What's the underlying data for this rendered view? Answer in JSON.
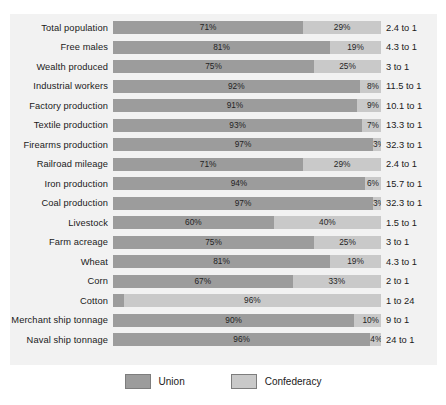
{
  "chart_data": {
    "type": "bar",
    "subtype": "stacked-horizontal-100pct",
    "title": "",
    "xlabel": "",
    "ylabel": "",
    "xlim": [
      0,
      100
    ],
    "grid": false,
    "legend_position": "bottom-center",
    "categories": [
      "Total population",
      "Free males",
      "Wealth produced",
      "Industrial workers",
      "Factory production",
      "Textile production",
      "Firearms production",
      "Railroad mileage",
      "Iron production",
      "Coal production",
      "Livestock",
      "Farm acreage",
      "Wheat",
      "Corn",
      "Cotton",
      "Merchant ship tonnage",
      "Naval ship tonnage"
    ],
    "series": [
      {
        "name": "Union",
        "color": "#9c9c9c",
        "values": [
          71,
          81,
          75,
          92,
          91,
          93,
          97,
          71,
          94,
          97,
          60,
          75,
          81,
          67,
          4,
          90,
          96
        ]
      },
      {
        "name": "Confederacy",
        "color": "#c9c9c9",
        "values": [
          29,
          19,
          25,
          8,
          9,
          7,
          3,
          29,
          6,
          3,
          40,
          25,
          19,
          33,
          96,
          10,
          4
        ]
      }
    ],
    "ratios": [
      "2.4 to 1",
      "4.3 to 1",
      "3 to 1",
      "11.5 to 1",
      "10.1 to 1",
      "13.3 to 1",
      "32.3 to 1",
      "2.4 to 1",
      "15.7 to 1",
      "32.3 to 1",
      "1.5 to 1",
      "3 to 1",
      "4.3 to 1",
      "2 to 1",
      "1 to 24",
      "9 to 1",
      "24 to 1"
    ]
  },
  "rows": [
    {
      "label": "Total population",
      "union": 71,
      "conf": 29,
      "union_text": "71%",
      "conf_text": "29%",
      "ratio": "2.4 to 1",
      "union_pos": "inside",
      "conf_pos": "inside",
      "union_lead": false,
      "conf_lead": false
    },
    {
      "label": "Free males",
      "union": 81,
      "conf": 19,
      "union_text": "81%",
      "conf_text": "19%",
      "ratio": "4.3 to 1",
      "union_pos": "inside",
      "conf_pos": "inside",
      "union_lead": false,
      "conf_lead": false
    },
    {
      "label": "Wealth produced",
      "union": 75,
      "conf": 25,
      "union_text": "75%",
      "conf_text": "25%",
      "ratio": "3 to 1",
      "union_pos": "inside",
      "conf_pos": "inside",
      "union_lead": false,
      "conf_lead": false
    },
    {
      "label": "Industrial workers",
      "union": 92,
      "conf": 8,
      "union_text": "92%",
      "conf_text": "8%",
      "ratio": "11.5 to 1",
      "union_pos": "inside",
      "conf_pos": "right",
      "union_lead": false,
      "conf_lead": false
    },
    {
      "label": "Factory production",
      "union": 91,
      "conf": 9,
      "union_text": "91%",
      "conf_text": "9%",
      "ratio": "10.1 to 1",
      "union_pos": "inside",
      "conf_pos": "right",
      "union_lead": false,
      "conf_lead": false
    },
    {
      "label": "Textile production",
      "union": 93,
      "conf": 7,
      "union_text": "93%",
      "conf_text": "7%",
      "ratio": "13.3 to 1",
      "union_pos": "inside",
      "conf_pos": "right",
      "union_lead": false,
      "conf_lead": false
    },
    {
      "label": "Firearms production",
      "union": 97,
      "conf": 3,
      "union_text": "97%",
      "conf_text": "3%",
      "ratio": "32.3 to 1",
      "union_pos": "inside",
      "conf_pos": "right",
      "union_lead": false,
      "conf_lead": true
    },
    {
      "label": "Railroad mileage",
      "union": 71,
      "conf": 29,
      "union_text": "71%",
      "conf_text": "29%",
      "ratio": "2.4 to 1",
      "union_pos": "inside",
      "conf_pos": "inside",
      "union_lead": false,
      "conf_lead": false
    },
    {
      "label": "Iron production",
      "union": 94,
      "conf": 6,
      "union_text": "94%",
      "conf_text": "6%",
      "ratio": "15.7 to 1",
      "union_pos": "inside",
      "conf_pos": "right",
      "union_lead": false,
      "conf_lead": false
    },
    {
      "label": "Coal production",
      "union": 97,
      "conf": 3,
      "union_text": "97%",
      "conf_text": "3%",
      "ratio": "32.3 to 1",
      "union_pos": "inside",
      "conf_pos": "right",
      "union_lead": false,
      "conf_lead": true
    },
    {
      "label": "Livestock",
      "union": 60,
      "conf": 40,
      "union_text": "60%",
      "conf_text": "40%",
      "ratio": "1.5 to 1",
      "union_pos": "inside",
      "conf_pos": "inside",
      "union_lead": false,
      "conf_lead": false
    },
    {
      "label": "Farm acreage",
      "union": 75,
      "conf": 25,
      "union_text": "75%",
      "conf_text": "25%",
      "ratio": "3 to 1",
      "union_pos": "inside",
      "conf_pos": "inside",
      "union_lead": false,
      "conf_lead": false
    },
    {
      "label": "Wheat",
      "union": 81,
      "conf": 19,
      "union_text": "81%",
      "conf_text": "19%",
      "ratio": "4.3 to 1",
      "union_pos": "inside",
      "conf_pos": "inside",
      "union_lead": false,
      "conf_lead": false
    },
    {
      "label": "Corn",
      "union": 67,
      "conf": 33,
      "union_text": "67%",
      "conf_text": "33%",
      "ratio": "2 to 1",
      "union_pos": "inside",
      "conf_pos": "inside",
      "union_lead": false,
      "conf_lead": false
    },
    {
      "label": "Cotton",
      "union": 4,
      "conf": 96,
      "union_text": "4%",
      "conf_text": "96%",
      "ratio": "1 to 24",
      "union_pos": "outside-left",
      "conf_pos": "inside",
      "union_lead": true,
      "conf_lead": false
    },
    {
      "label": "Merchant ship tonnage",
      "union": 90,
      "conf": 10,
      "union_text": "90%",
      "conf_text": "10%",
      "ratio": "9 to 1",
      "union_pos": "inside",
      "conf_pos": "right",
      "union_lead": false,
      "conf_lead": false
    },
    {
      "label": "Naval ship tonnage",
      "union": 96,
      "conf": 4,
      "union_text": "96%",
      "conf_text": "4%",
      "ratio": "24 to 1",
      "union_pos": "inside",
      "conf_pos": "right",
      "union_lead": false,
      "conf_lead": true
    }
  ],
  "legend": {
    "items": [
      {
        "label": "Union",
        "color": "#9c9c9c"
      },
      {
        "label": "Confederacy",
        "color": "#c9c9c9"
      }
    ]
  }
}
